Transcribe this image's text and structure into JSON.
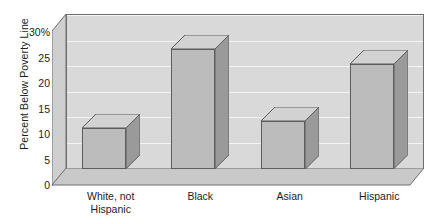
{
  "chart_data": {
    "type": "bar",
    "title": "",
    "xlabel": "",
    "ylabel": "Percent Below Poverty Line",
    "categories": [
      "White, not\nHispanic",
      "Black",
      "Asian",
      "Hispanic"
    ],
    "values": [
      8,
      23.5,
      9.5,
      20.5
    ],
    "ylim": [
      0,
      30
    ],
    "yticks": [
      0,
      5,
      10,
      15,
      20,
      25,
      30
    ],
    "ytick_labels": [
      "0",
      "5",
      "10",
      "15",
      "20",
      "25",
      "30%"
    ],
    "grid": true,
    "legend": "none",
    "style": "3d-bar",
    "colors": {
      "bar_front": "#bcbcbc",
      "bar_side": "#9a9a9a",
      "bar_top": "#d2d2d2",
      "plot_background": "#d9d9d9",
      "wall_side": "#cfcfcf",
      "floor": "#c9c9c9",
      "gridline": "#f4f4f4",
      "axis_line": "#6e6e6e",
      "text": "#1d1d1d"
    }
  },
  "axes": {
    "y_title": "Percent Below Poverty Line",
    "ticks": [
      {
        "label": "30%",
        "value": 30
      },
      {
        "label": "25",
        "value": 25
      },
      {
        "label": "20",
        "value": 20
      },
      {
        "label": "15",
        "value": 15
      },
      {
        "label": "10",
        "value": 10
      },
      {
        "label": "5",
        "value": 5
      },
      {
        "label": "0",
        "value": 0
      }
    ]
  },
  "categories": [
    {
      "label": "White, not\nHispanic",
      "value": 8
    },
    {
      "label": "Black",
      "value": 23.5
    },
    {
      "label": "Asian",
      "value": 9.5
    },
    {
      "label": "Hispanic",
      "value": 20.5
    }
  ]
}
